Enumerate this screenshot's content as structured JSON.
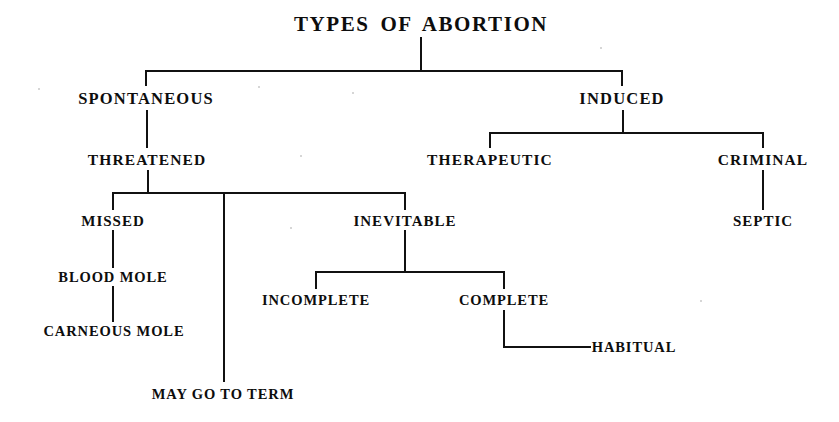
{
  "diagram": {
    "title": "TYPES OF ABORTION",
    "type": "tree",
    "background_color": "#ffffff",
    "line_color": "#111111",
    "text_color": "#0d0d0d",
    "nodes": [
      {
        "id": "root",
        "label": "TYPES OF ABORTION",
        "level": 0,
        "x": 421,
        "y": 24
      },
      {
        "id": "spontaneous",
        "label": "SPONTANEOUS",
        "level": 1,
        "x": 146,
        "y": 99
      },
      {
        "id": "induced",
        "label": "INDUCED",
        "level": 1,
        "x": 622,
        "y": 99
      },
      {
        "id": "threatened",
        "label": "THREATENED",
        "level": 2,
        "x": 147,
        "y": 160
      },
      {
        "id": "therapeutic",
        "label": "THERAPEUTIC",
        "level": 2,
        "x": 490,
        "y": 160
      },
      {
        "id": "criminal",
        "label": "CRIMINAL",
        "level": 2,
        "x": 763,
        "y": 160
      },
      {
        "id": "missed",
        "label": "MISSED",
        "level": 3,
        "x": 113,
        "y": 221
      },
      {
        "id": "inevitable",
        "label": "INEVITABLE",
        "level": 3,
        "x": 405,
        "y": 221
      },
      {
        "id": "septic",
        "label": "SEPTIC",
        "level": 3,
        "x": 763,
        "y": 221
      },
      {
        "id": "blood_mole",
        "label": "BLOOD MOLE",
        "level": 4,
        "x": 113,
        "y": 277
      },
      {
        "id": "incomplete",
        "label": "INCOMPLETE",
        "level": 4,
        "x": 316,
        "y": 300
      },
      {
        "id": "complete",
        "label": "COMPLETE",
        "level": 4,
        "x": 504,
        "y": 300
      },
      {
        "id": "carneous_mole",
        "label": "CARNEOUS MOLE",
        "level": 4,
        "x": 114,
        "y": 331
      },
      {
        "id": "habitual",
        "label": "HABITUAL",
        "level": 4,
        "x": 634,
        "y": 347
      },
      {
        "id": "may_go_term",
        "label": "MAY GO TO TERM",
        "level": 4,
        "x": 223,
        "y": 394
      }
    ],
    "edges": [
      {
        "from": "root",
        "to": "spontaneous"
      },
      {
        "from": "root",
        "to": "induced"
      },
      {
        "from": "spontaneous",
        "to": "threatened"
      },
      {
        "from": "induced",
        "to": "therapeutic"
      },
      {
        "from": "induced",
        "to": "criminal"
      },
      {
        "from": "criminal",
        "to": "septic"
      },
      {
        "from": "threatened",
        "to": "missed"
      },
      {
        "from": "threatened",
        "to": "inevitable"
      },
      {
        "from": "threatened",
        "to": "may_go_term"
      },
      {
        "from": "missed",
        "to": "blood_mole"
      },
      {
        "from": "blood_mole",
        "to": "carneous_mole"
      },
      {
        "from": "inevitable",
        "to": "incomplete"
      },
      {
        "from": "inevitable",
        "to": "complete"
      },
      {
        "from": "complete",
        "to": "habitual"
      }
    ]
  }
}
